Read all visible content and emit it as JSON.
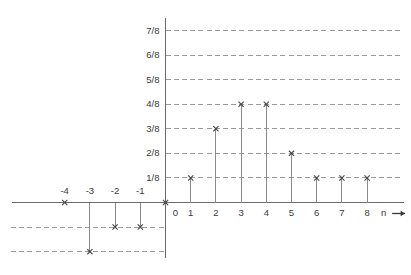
{
  "chart_data": {
    "type": "bar",
    "subtype": "stem-plot",
    "title": "",
    "xlabel": "n",
    "ylabel": "",
    "xlim": [
      -4.6,
      8.9
    ],
    "ylim": [
      -0.3125,
      0.9375
    ],
    "grid": true,
    "legend": false,
    "x": [
      -4,
      -3,
      -2,
      -1,
      0,
      1,
      2,
      3,
      4,
      5,
      6,
      7,
      8
    ],
    "values": [
      0,
      -0.25,
      -0.125,
      -0.125,
      0,
      0.125,
      0.375,
      0.5,
      0.5,
      0.25,
      0.125,
      0.125,
      0.125
    ],
    "value_labels": [
      "0",
      "-2/8",
      "-1/8",
      "-1/8",
      "0",
      "1/8",
      "3/8",
      "4/8",
      "4/8",
      "2/8",
      "1/8",
      "1/8",
      "1/8"
    ],
    "ytick_values": [
      0.125,
      0.25,
      0.375,
      0.5,
      0.625,
      0.75,
      0.875
    ],
    "ytick_labels": [
      "1/8",
      "2/8",
      "3/8",
      "4/8",
      "5/8",
      "6/8",
      "7/8"
    ],
    "ytick_negative_values": [
      -0.125,
      -0.25
    ],
    "xtick_labels": [
      "-4",
      "-3",
      "-2",
      "-1",
      "0",
      "1",
      "2",
      "3",
      "4",
      "5",
      "6",
      "7",
      "8"
    ],
    "axis_arrow_label": "n",
    "marker": "cross",
    "colors": {
      "axis": "#6b6b6b",
      "stem": "#8a8a8a",
      "grid": "#9a9a9a",
      "marker": "#444444",
      "text": "#3a3a3a",
      "background": "#ffffff"
    }
  }
}
